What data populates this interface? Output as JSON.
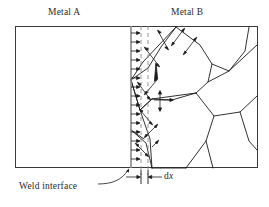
{
  "figure": {
    "title_left": "Metal A",
    "title_right": "Metal B",
    "weld_interface_label": "Weld interface",
    "dx_label_prefix": "d",
    "dx_label_var": "x",
    "dx_label_full": "dx"
  },
  "colors": {
    "line": "#1a1a1a",
    "interface": "#8a8a8a",
    "dashed": "#8a8a8a",
    "frame": "#3a3a3a",
    "background": "#ffffff",
    "text": "#2b2b2b"
  },
  "geometry": {
    "frame": {
      "x": 15,
      "y": 26,
      "width": 243,
      "height": 142
    },
    "weld_interface_x": 131,
    "dashed_line_1_x": 141,
    "dashed_line_2_x": 148,
    "arrow_count": 16,
    "arrow_start_x": 131,
    "arrow_end_x": 140
  },
  "annotations": {
    "growth_arrow_count": 16,
    "dimension_line_y": 177
  }
}
